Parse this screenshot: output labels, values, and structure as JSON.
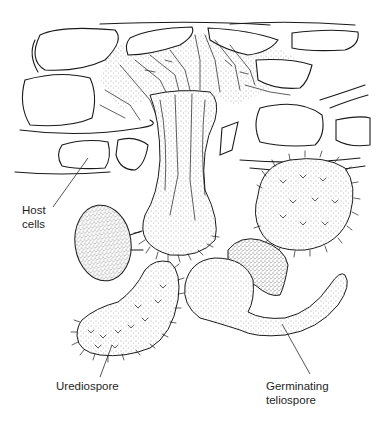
{
  "diagram": {
    "colors": {
      "line": "#1a1a1a",
      "background": "#ffffff",
      "stipple": "#555555"
    },
    "labels": {
      "host_cells": {
        "line1": "Host",
        "line2": "cells"
      },
      "urediospore": {
        "line1": "Urediospore"
      },
      "germinating_teliospore": {
        "line1": "Germinating",
        "line2": "teliospore"
      }
    }
  }
}
